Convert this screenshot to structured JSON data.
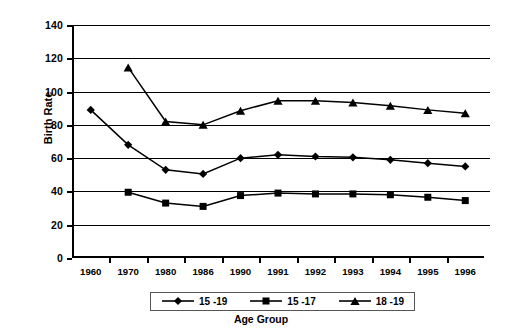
{
  "chart_data": {
    "type": "line",
    "title": "",
    "xlabel": "Age Group",
    "ylabel": "Birth Rate",
    "categories": [
      "1960",
      "1970",
      "1980",
      "1986",
      "1990",
      "1991",
      "1992",
      "1993",
      "1994",
      "1995",
      "1996"
    ],
    "ylim": [
      0,
      140
    ],
    "ytick_step": 20,
    "yticks": [
      0,
      20,
      40,
      60,
      80,
      100,
      120,
      140
    ],
    "grid": "horizontal",
    "legend_position": "bottom",
    "series": [
      {
        "name": "15 -19",
        "marker": "diamond",
        "color": "#000000",
        "values": [
          89,
          68,
          53,
          50.5,
          60,
          62,
          61,
          60.5,
          59,
          57,
          55
        ]
      },
      {
        "name": "15 -17",
        "marker": "square",
        "color": "#000000",
        "values": [
          null,
          39.5,
          33,
          31,
          37.5,
          39,
          38.5,
          38.5,
          38,
          36.5,
          34.5
        ]
      },
      {
        "name": "18 -19",
        "marker": "triangle",
        "color": "#000000",
        "values": [
          null,
          114.5,
          82,
          80,
          88.5,
          94.5,
          94.5,
          93.5,
          91.5,
          89,
          87
        ]
      }
    ]
  },
  "axis": {
    "y_title": "Birth Rate",
    "x_title": "Age Group"
  },
  "legend": {
    "items": [
      {
        "label": "15 -19",
        "marker": "diamond-marker-icon"
      },
      {
        "label": "15 -17",
        "marker": "square-marker-icon"
      },
      {
        "label": "18 -19",
        "marker": "triangle-marker-icon"
      }
    ]
  }
}
